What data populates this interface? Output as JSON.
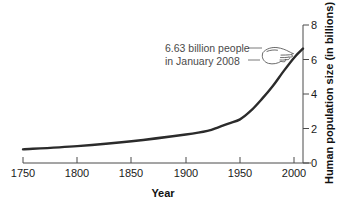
{
  "chart_data": {
    "type": "line",
    "title": "",
    "subtitle": "",
    "xlabel": "Year",
    "ylabel": "Human population size (in billions)",
    "xlim": [
      1750,
      2008
    ],
    "ylim": [
      0,
      8
    ],
    "grid": false,
    "legend": "none",
    "y_axis_position": "right",
    "x_ticks": [
      "1750",
      "1800",
      "1850",
      "1900",
      "1950",
      "2000"
    ],
    "x_tick_values": [
      1750,
      1800,
      1850,
      1900,
      1950,
      2000
    ],
    "y_ticks": [
      "0",
      "2",
      "4",
      "6",
      "8"
    ],
    "y_tick_values": [
      0,
      2,
      4,
      6,
      8
    ],
    "series": [
      {
        "name": "Human population",
        "color": "#2b2b2b",
        "x": [
          1750,
          1800,
          1850,
          1900,
          1920,
          1930,
          1940,
          1950,
          1960,
          1970,
          1980,
          1990,
          2000,
          2008
        ],
        "values": [
          0.79,
          0.98,
          1.26,
          1.65,
          1.86,
          2.07,
          2.3,
          2.53,
          3.03,
          3.7,
          4.45,
          5.31,
          6.12,
          6.63
        ]
      }
    ],
    "annotations": [
      {
        "name": "population-2008-callout",
        "line1": "6.63 billion people",
        "line2": "in January 2008",
        "pointer_icon": "pointing-hand-icon",
        "target_year": 2008,
        "target_value": 6.63
      }
    ]
  },
  "axes": {
    "x_title": "Year",
    "y_title": "Human population size (in billions)"
  }
}
